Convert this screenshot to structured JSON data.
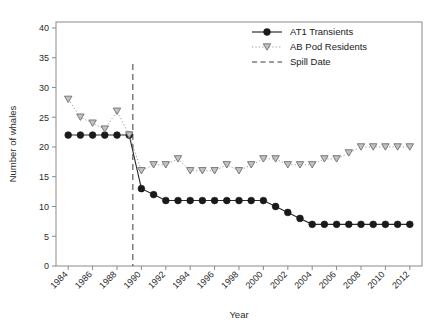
{
  "chart_data": {
    "type": "line",
    "title": "",
    "xlabel": "Year",
    "ylabel": "Number of whales",
    "xlim": [
      1983,
      2013
    ],
    "ylim": [
      0,
      41
    ],
    "grid": false,
    "legend_position": "top-right",
    "x_ticks": [
      1984,
      1986,
      1988,
      1990,
      1992,
      1994,
      1996,
      1998,
      2000,
      2002,
      2004,
      2006,
      2008,
      2010,
      2012
    ],
    "y_ticks": [
      0,
      5,
      10,
      15,
      20,
      25,
      30,
      35,
      40
    ],
    "x": [
      1984,
      1985,
      1986,
      1987,
      1988,
      1989,
      1990,
      1991,
      1992,
      1993,
      1994,
      1995,
      1996,
      1997,
      1998,
      1999,
      2000,
      2001,
      2002,
      2003,
      2004,
      2005,
      2006,
      2007,
      2008,
      2009,
      2010,
      2011,
      2012
    ],
    "series": [
      {
        "name": "AT1 Transients",
        "marker": "filled-circle",
        "color": "#1a1a1a",
        "linestyle": "solid",
        "values": [
          22,
          22,
          22,
          22,
          22,
          22,
          13,
          12,
          11,
          11,
          11,
          11,
          11,
          11,
          11,
          11,
          11,
          10,
          9,
          8,
          7,
          7,
          7,
          7,
          7,
          7,
          7,
          7,
          7
        ]
      },
      {
        "name": "AB Pod Residents",
        "marker": "down-triangle",
        "color": "#c2c2c2",
        "linestyle": "dotted",
        "values": [
          28,
          25,
          24,
          23,
          26,
          22,
          16,
          17,
          17,
          18,
          16,
          16,
          16,
          17,
          16,
          17,
          18,
          18,
          17,
          17,
          17,
          18,
          18,
          19,
          20,
          20,
          20,
          20,
          20
        ]
      }
    ],
    "annotations": [
      {
        "name": "Spill Date",
        "type": "vline",
        "x": 1989.3,
        "linestyle": "dashed",
        "color": "#3a3a3a"
      }
    ],
    "legend": [
      {
        "label": "AT1 Transients",
        "marker": "filled-circle",
        "linestyle": "solid"
      },
      {
        "label": "AB Pod Residents",
        "marker": "down-triangle",
        "linestyle": "dotted"
      },
      {
        "label": "Spill Date",
        "marker": "none",
        "linestyle": "dashed"
      }
    ]
  }
}
